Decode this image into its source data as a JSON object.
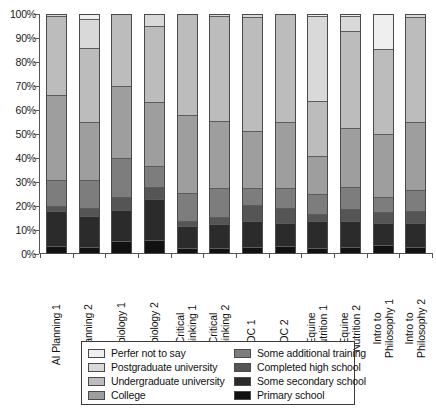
{
  "chart_data": {
    "type": "bar",
    "subtype": "stacked-percentage-bar",
    "title": "",
    "xlabel": "",
    "ylabel": "",
    "ylim": [
      0,
      100
    ],
    "yunit": "%",
    "grid": false,
    "legend_position": "bottom",
    "y_ticks": [
      "0%",
      "10%",
      "20%",
      "30%",
      "40%",
      "50%",
      "60%",
      "70%",
      "80%",
      "90%",
      "100%"
    ],
    "y_tick_values": [
      0,
      10,
      20,
      30,
      40,
      50,
      60,
      70,
      80,
      90,
      100
    ],
    "categories": [
      "AI Planning 1",
      "AI Planning 2",
      "Astrobiology 1",
      "Astrobiology 2",
      "Critical Thinking 1",
      "Critical Thinking 2",
      "EDC 1",
      "EDC 2",
      "Equine Nutrition 1",
      "Equine Nutrition 2",
      "Intro to Philosophy 1",
      "Intro to Philosophy 2"
    ],
    "category_lines": [
      [
        "AI Planning 1"
      ],
      [
        "AI Planning 2"
      ],
      [
        "Astrobiology 1"
      ],
      [
        "Astrobiology 2"
      ],
      [
        "Critical",
        "Thinking 1"
      ],
      [
        "Critical",
        "Thinking 2"
      ],
      [
        "EDC 1"
      ],
      [
        "EDC 2"
      ],
      [
        "Equine",
        "Nutrition 1"
      ],
      [
        "Equine",
        "Nutrition 2"
      ],
      [
        "Intro to",
        "Philosophy 1"
      ],
      [
        "Intro to",
        "Philosophy 2"
      ]
    ],
    "series": [
      {
        "name": "Primary school",
        "color": "#111111",
        "values": [
          2.5,
          2.0,
          4.5,
          5.0,
          1.5,
          1.5,
          2.0,
          2.5,
          1.5,
          2.0,
          3.0,
          2.0
        ]
      },
      {
        "name": "Some secondary school",
        "color": "#2b2b2b",
        "values": [
          14.5,
          13.0,
          13.0,
          17.0,
          9.5,
          10.0,
          11.0,
          9.5,
          11.5,
          11.0,
          9.0,
          10.0
        ]
      },
      {
        "name": "Completed high school",
        "color": "#555555",
        "values": [
          2.0,
          3.5,
          5.5,
          5.0,
          2.0,
          3.0,
          6.5,
          6.5,
          3.0,
          5.0,
          4.5,
          5.0
        ]
      },
      {
        "name": "Some additional training",
        "color": "#7d7d7d",
        "values": [
          11.0,
          11.5,
          16.0,
          9.0,
          11.5,
          12.0,
          7.0,
          8.0,
          8.0,
          9.0,
          6.5,
          9.0
        ]
      },
      {
        "name": "College",
        "color": "#9e9e9e",
        "values": [
          35.5,
          24.0,
          30.0,
          26.5,
          32.5,
          28.0,
          24.0,
          27.5,
          16.0,
          24.5,
          26.0,
          28.0
        ]
      },
      {
        "name": "Undergraduate university",
        "color": "#bcbcbc",
        "values": [
          33.0,
          31.0,
          30.5,
          31.5,
          42.0,
          44.0,
          47.5,
          45.0,
          23.0,
          40.5,
          35.5,
          44.0
        ]
      },
      {
        "name": "Postgraduate university",
        "color": "#d9d9d9",
        "values": [
          0.5,
          12.0,
          0.0,
          5.5,
          0.5,
          0.5,
          1.0,
          0.5,
          35.5,
          6.5,
          0.0,
          1.0
        ]
      },
      {
        "name": "Perfer not to say",
        "color": "#efefef",
        "values": [
          1.0,
          3.0,
          0.5,
          0.5,
          0.5,
          1.0,
          1.0,
          0.5,
          1.5,
          1.5,
          15.5,
          1.0
        ]
      }
    ]
  },
  "legend": {
    "left_column": [
      {
        "label": "Perfer not to say",
        "color": "#efefef"
      },
      {
        "label": "Postgraduate university",
        "color": "#d9d9d9"
      },
      {
        "label": "Undergraduate university",
        "color": "#bcbcbc"
      },
      {
        "label": "College",
        "color": "#9e9e9e"
      }
    ],
    "right_column": [
      {
        "label": "Some additional training",
        "color": "#7d7d7d"
      },
      {
        "label": "Completed high school",
        "color": "#555555"
      },
      {
        "label": "Some secondary school",
        "color": "#2b2b2b"
      },
      {
        "label": "Primary school",
        "color": "#111111"
      }
    ]
  }
}
